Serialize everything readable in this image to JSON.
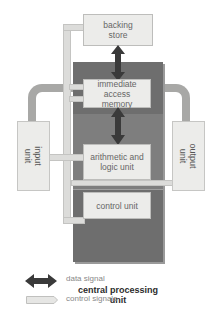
{
  "diagram": {
    "boxes": {
      "backing_store": "backing\nstore",
      "backing_store_l1": "backing",
      "backing_store_l2": "store",
      "memory_l1": "immediate access",
      "memory_l2": "memory",
      "alu_l1": "arithmetic and",
      "alu_l2": "logic unit",
      "control_unit": "control unit",
      "input_l1": "input",
      "input_l2": "unit",
      "output_l1": "output",
      "output_l2": "unit",
      "cpu_l1": "central processing",
      "cpu_l2": "unit"
    },
    "legend": {
      "data_signal": "data signal",
      "control_signals": "control signals"
    },
    "colors": {
      "cpu_block": "#6e6e6e",
      "box_fill": "#ececea",
      "data_arrow": "#3a3a3a",
      "control_bus": "#dcdcda",
      "io_path": "#a8a8a6"
    }
  }
}
